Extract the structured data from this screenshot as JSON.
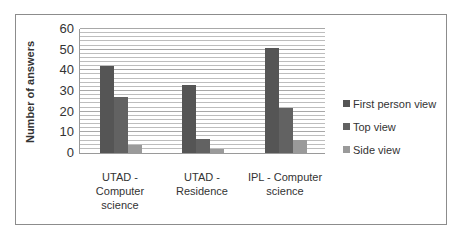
{
  "chart_data": {
    "type": "bar",
    "title": "",
    "xlabel": "",
    "ylabel": "Number of answers",
    "ylim": [
      0,
      60
    ],
    "yticks": [
      0,
      10,
      20,
      30,
      40,
      50,
      60
    ],
    "grid": true,
    "grid_step": 2,
    "legend_position": "right",
    "categories": [
      "UTAD - Computer science",
      "UTAD - Residence",
      "IPL - Computer science"
    ],
    "category_label_lines": [
      [
        "UTAD -",
        "Computer",
        "science"
      ],
      [
        "UTAD -",
        "Residence"
      ],
      [
        "IPL - Computer",
        "science"
      ]
    ],
    "series": [
      {
        "name": "First person view",
        "color": "#555555",
        "values": [
          42,
          33,
          51
        ]
      },
      {
        "name": "Top view",
        "color": "#626262",
        "values": [
          27,
          7,
          22
        ]
      },
      {
        "name": "Side view",
        "color": "#9a9a9a",
        "values": [
          4,
          2,
          6.5
        ]
      }
    ]
  }
}
